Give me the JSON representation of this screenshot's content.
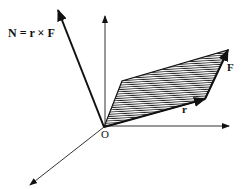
{
  "diagram": {
    "labels": {
      "torque": "N = r × F",
      "force": "F",
      "position": "r",
      "origin": "O"
    },
    "colors": {
      "stroke": "#111111",
      "hatch": "#222222",
      "background": "#ffffff"
    }
  }
}
